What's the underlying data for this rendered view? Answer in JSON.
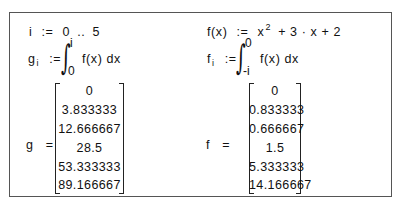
{
  "worksheet": {
    "left": {
      "range_def": {
        "var": "i",
        "assign": ":=",
        "start": "0",
        "dots": "..",
        "end": "5"
      },
      "integral_def": {
        "lhs_var": "g",
        "lhs_sub": "i",
        "assign": ":=",
        "upper": "i",
        "lower": "0",
        "integrand": "f(x) dx"
      },
      "result": {
        "var": "g",
        "eq": "=",
        "values": [
          "0",
          "3.833333",
          "12.666667",
          "28.5",
          "53.333333",
          "89.166667"
        ]
      }
    },
    "right": {
      "function_def": {
        "lhs": "f(x)",
        "assign": ":=",
        "rhs_part1": "x",
        "exponent": "2",
        "rhs_part2": "+ 3 · x + 2"
      },
      "integral_def": {
        "lhs_var": "f",
        "lhs_sub": "i",
        "assign": ":=",
        "upper": "0",
        "lower": "-i",
        "integrand": "f(x) dx"
      },
      "result": {
        "var": "f",
        "eq": "=",
        "values": [
          "0",
          "0.833333",
          "0.666667",
          "1.5",
          "5.333333",
          "14.166667"
        ]
      }
    }
  }
}
